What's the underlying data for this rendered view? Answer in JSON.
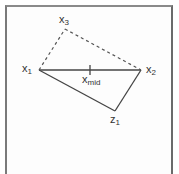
{
  "diagram": {
    "nodes": {
      "x1": {
        "label": "x",
        "sub": "1",
        "x": 39,
        "y": 70
      },
      "x2": {
        "label": "x",
        "sub": "2",
        "x": 141,
        "y": 70
      },
      "x3": {
        "label": "x",
        "sub": "3",
        "x": 65,
        "y": 29
      },
      "z1": {
        "label": "z",
        "sub": "1",
        "x": 115,
        "y": 111
      },
      "xmid": {
        "label": "x",
        "sub": "mid",
        "x": 90,
        "y": 70
      }
    },
    "edges": [
      {
        "from": "x1",
        "to": "x2",
        "style": "solid"
      },
      {
        "from": "x1",
        "to": "z1",
        "style": "solid"
      },
      {
        "from": "z1",
        "to": "x2",
        "style": "solid"
      },
      {
        "from": "x1",
        "to": "x3",
        "style": "dashed"
      },
      {
        "from": "x3",
        "to": "x2",
        "style": "dashed"
      }
    ],
    "colors": {
      "line": "#444444",
      "frame": "#777777",
      "text": "#333333"
    }
  }
}
